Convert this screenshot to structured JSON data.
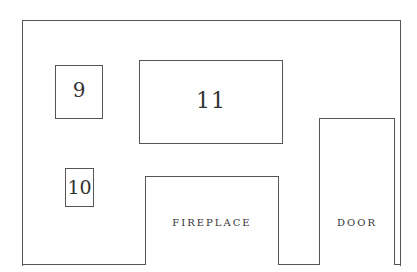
{
  "diagram": {
    "type": "wall-layout",
    "items": [
      {
        "id": "9",
        "label": "9"
      },
      {
        "id": "10",
        "label": "10"
      },
      {
        "id": "11",
        "label": "11"
      },
      {
        "id": "fireplace",
        "label": "FIREPLACE"
      },
      {
        "id": "door",
        "label": "DOOR"
      }
    ]
  }
}
